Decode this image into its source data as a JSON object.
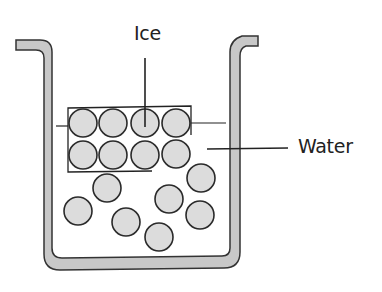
{
  "diagram": {
    "labels": {
      "ice": "Ice",
      "water": "Water"
    },
    "colors": {
      "container_fill": "#c8c8c8",
      "container_stroke": "#333333",
      "particle_fill": "#dcdcdc",
      "particle_stroke": "#2a2a2a",
      "line": "#222222"
    },
    "ice_particles": [
      {
        "cx": 83,
        "cy": 123
      },
      {
        "cx": 113,
        "cy": 123
      },
      {
        "cx": 145,
        "cy": 123
      },
      {
        "cx": 176,
        "cy": 123
      },
      {
        "cx": 83,
        "cy": 155
      },
      {
        "cx": 113,
        "cy": 155
      },
      {
        "cx": 145,
        "cy": 155
      },
      {
        "cx": 176,
        "cy": 154
      }
    ],
    "water_particles": [
      {
        "cx": 107,
        "cy": 188
      },
      {
        "cx": 201,
        "cy": 178
      },
      {
        "cx": 169,
        "cy": 199
      },
      {
        "cx": 78,
        "cy": 211
      },
      {
        "cx": 200,
        "cy": 215
      },
      {
        "cx": 126,
        "cy": 222
      },
      {
        "cx": 159,
        "cy": 237
      }
    ],
    "particle_radius": 14
  }
}
